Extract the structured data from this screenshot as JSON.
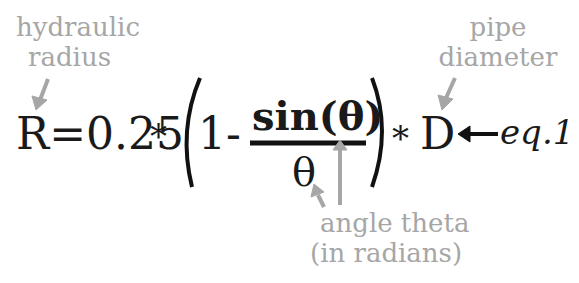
{
  "annotations": {
    "hydraulic_radius": [
      "hydraulic",
      "radius"
    ],
    "pipe_diameter": [
      "pipe",
      "diameter"
    ],
    "angle_theta": [
      "angle theta",
      "(in radians)"
    ]
  },
  "equation": {
    "lhs": "R",
    "equals": "=",
    "coefficient": "0.25",
    "times1": "*",
    "one_minus": "1-",
    "numerator": "sin(θ)",
    "denominator": "θ",
    "times2": "*",
    "rhs_var": "D",
    "label": "eq.1"
  },
  "colors": {
    "annotation": "#a6a6a6",
    "equation": "#1a1a1a"
  }
}
